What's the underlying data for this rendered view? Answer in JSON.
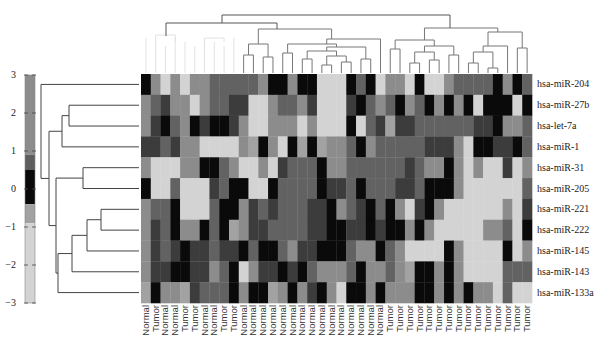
{
  "chart_data": {
    "type": "heatmap",
    "title": "",
    "xlabel": "",
    "ylabel": "",
    "rows": [
      "hsa-miR-204",
      "hsa-miR-27b",
      "hsa-let-7a",
      "hsa-miR-1",
      "hsa-miR-31",
      "hsa-miR-205",
      "hsa-miR-221",
      "hsa-miR-222",
      "hsa-miR-145",
      "hsa-miR-143",
      "hsa-miR-133a"
    ],
    "columns": [
      "Normal",
      "Tumor",
      "Normal",
      "Normal",
      "Tumor",
      "Tumor",
      "Normal",
      "Normal",
      "Tumor",
      "Tumor",
      "Normal",
      "Normal",
      "Normal",
      "Normal",
      "Normal",
      "Normal",
      "Normal",
      "Normal",
      "Normal",
      "Normal",
      "Normal",
      "Normal",
      "Normal",
      "Normal",
      "Normal",
      "Tumor",
      "Tumor",
      "Tumor",
      "Tumor",
      "Tumor",
      "Tumor",
      "Tumor",
      "Tumor",
      "Tumor",
      "Tumor",
      "Tumor",
      "Tumor",
      "Tumor",
      "Tumor",
      "Tumor"
    ],
    "values": [
      [
        0,
        2,
        -2,
        2,
        -2,
        2,
        2,
        1,
        1,
        1,
        1,
        1,
        2,
        0,
        0,
        2,
        0,
        0,
        -2,
        -2,
        -2,
        0,
        1,
        0,
        -2,
        2,
        2,
        -2,
        0,
        -2,
        -2,
        2,
        1,
        1,
        1,
        1,
        0,
        2,
        0,
        1
      ],
      [
        2,
        1,
        0.5,
        2,
        2,
        -2,
        2,
        1,
        1,
        0.5,
        0.5,
        -2,
        -2,
        2,
        1,
        1,
        2,
        0.5,
        -2,
        -2,
        -2,
        0.5,
        0,
        1,
        2,
        1,
        0,
        2,
        1,
        0,
        2,
        0,
        2,
        0,
        -2,
        0,
        0,
        0,
        -2,
        0
      ],
      [
        2,
        0.5,
        0,
        1,
        2,
        0,
        0.5,
        0,
        0,
        0.5,
        2,
        -2,
        -2,
        2,
        2,
        2,
        -2,
        2,
        -2,
        -2,
        -2,
        0,
        -2,
        1,
        0.5,
        -0.7,
        0.5,
        0.5,
        1,
        1,
        1,
        1,
        1,
        1,
        0.5,
        0.5,
        0,
        2,
        2,
        1
      ],
      [
        0.5,
        0.5,
        1,
        0.5,
        2,
        2,
        -2,
        -2,
        -2,
        -2,
        2,
        -0.7,
        0,
        2,
        -2,
        0,
        -0.7,
        0,
        -0.7,
        2,
        2,
        1,
        0,
        2,
        1,
        1,
        1,
        1,
        1,
        0.5,
        0.5,
        0.5,
        2,
        -2,
        0,
        0,
        0.5,
        0.5,
        0,
        1
      ],
      [
        2,
        -2,
        -2,
        -2,
        2,
        2,
        0,
        0,
        1,
        2,
        -2,
        -2,
        2,
        -2,
        0.5,
        1,
        1,
        1,
        0,
        2,
        2,
        1,
        1,
        1,
        1,
        1,
        1,
        0.5,
        1,
        2,
        2,
        0,
        2,
        -2,
        2,
        -2,
        -2,
        0.5,
        -2,
        2
      ],
      [
        0,
        -2,
        -2,
        1,
        -2,
        -2,
        -2,
        0.5,
        1,
        0,
        0,
        -2,
        -2,
        0,
        1,
        1,
        1,
        1,
        0,
        0.5,
        0.5,
        1,
        0,
        1,
        1,
        1,
        0.5,
        0.5,
        1,
        0,
        0,
        0,
        2,
        -2,
        -2,
        -2,
        -2,
        -2,
        -2,
        1
      ],
      [
        2,
        1,
        1,
        0,
        -2,
        -2,
        -2,
        1,
        0,
        0,
        2,
        0.5,
        1,
        0.5,
        1,
        1,
        1,
        0.5,
        0.5,
        0,
        2,
        1,
        0.5,
        0,
        1,
        0,
        2,
        -2,
        0.5,
        0,
        2,
        -2,
        -2,
        -2,
        -2,
        -2,
        -2,
        2,
        -2,
        0.5
      ],
      [
        2,
        0.5,
        1,
        0,
        2,
        2,
        0,
        1,
        0,
        -0.7,
        2,
        0.5,
        0.5,
        1,
        1,
        1,
        1,
        0.5,
        0.5,
        0,
        0,
        0.5,
        0.5,
        0,
        0.5,
        0,
        0,
        2,
        0,
        2,
        -2,
        -2,
        -2,
        -2,
        -2,
        2,
        2,
        1,
        -2,
        0
      ],
      [
        2,
        0.5,
        1,
        0.5,
        0,
        0.5,
        0.5,
        1,
        0.5,
        0.5,
        0,
        1,
        0,
        0,
        1,
        2,
        0.5,
        0.5,
        0,
        0,
        0,
        1,
        2,
        2,
        0,
        1,
        2,
        -2,
        -2,
        -2,
        -2,
        0,
        2,
        -2,
        -2,
        -2,
        -2,
        0,
        -2,
        2
      ],
      [
        2,
        0.5,
        0.5,
        0,
        0,
        0.5,
        0.5,
        2,
        1,
        0,
        -2,
        2,
        0.5,
        0.5,
        0,
        0.5,
        0,
        1,
        2,
        2,
        2,
        1,
        0,
        2,
        2,
        1,
        2,
        -0.7,
        0,
        0,
        2,
        0,
        2,
        -2,
        -2,
        -2,
        -2,
        1,
        1,
        1
      ],
      [
        -0.7,
        0,
        2,
        2,
        -0.7,
        0.5,
        1,
        1,
        1,
        0,
        2,
        0,
        0,
        -0.7,
        2,
        0,
        2,
        0.5,
        0,
        2,
        -2,
        0,
        0,
        2,
        0,
        2,
        2,
        2,
        0,
        0,
        2,
        0,
        2,
        0,
        2,
        2,
        -2,
        1,
        -2,
        -2
      ]
    ],
    "colorbar": {
      "ticks": [
        3,
        2,
        1,
        0,
        -1,
        -2,
        -3
      ],
      "range": [
        -3,
        3
      ]
    },
    "row_dendrogram": true,
    "col_dendrogram": true,
    "colors": {
      "low": "#d3d3d3",
      "mid_low": "#a2a2a2",
      "zero": "#0a0a0a",
      "mid_high": "#4a4a4a",
      "high": "#8c8c8c"
    }
  }
}
